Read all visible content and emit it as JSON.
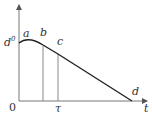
{
  "diagram": {
    "axes": {
      "x_label": "t",
      "origin_label": "0",
      "y_value_label": "d",
      "y_value_superscript": "0"
    },
    "points": {
      "a": "a",
      "b": "b",
      "c": "c",
      "d": "d"
    },
    "tick_labels": {
      "tau": "τ"
    },
    "colors": {
      "axis": "#555555",
      "curve": "#222222",
      "guide": "#888888"
    }
  }
}
